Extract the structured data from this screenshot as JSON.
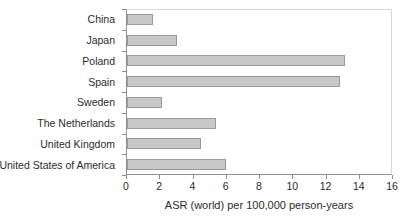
{
  "chart_data": {
    "type": "bar",
    "orientation": "horizontal",
    "title": "",
    "xlabel": "ASR (world) per 100,000 person-years",
    "ylabel": "",
    "categories": [
      "China",
      "Japan",
      "Poland",
      "Spain",
      "Sweden",
      "The Netherlands",
      "United Kingdom",
      "United States of America"
    ],
    "values": [
      1.6,
      3.0,
      13.2,
      12.9,
      2.1,
      5.4,
      4.5,
      6.0
    ],
    "xlim": [
      0,
      16
    ],
    "xticks": [
      0,
      2,
      4,
      6,
      8,
      10,
      12,
      14,
      16
    ],
    "grid": false,
    "legend": false,
    "colors": {
      "bar_fill": "#c8c8c8",
      "bar_border": "#9a9a9a",
      "axis_line": "#8f8f8f",
      "plot_border": "#d9d9d9",
      "text": "#2b2b2b",
      "background": "#ffffff"
    }
  }
}
